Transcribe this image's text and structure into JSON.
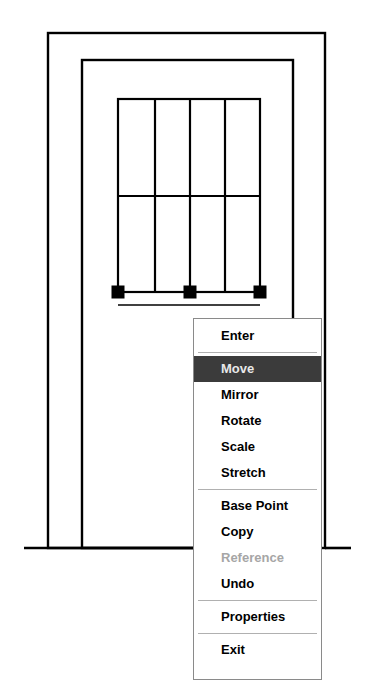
{
  "canvas": {
    "width": 373,
    "height": 695,
    "background": "#ffffff",
    "line_color": "#000000",
    "grip_color": "#000000",
    "dashed_color": "#000000"
  },
  "drawing": {
    "name": "cad-elevation-drawing",
    "description": "Architectural elevation: nested rectangles with mullioned window grid and three selection grips joined by a dashed stretch line",
    "outer_rect": {
      "x": 48,
      "y": 33,
      "width": 277,
      "height": 515
    },
    "middle_rect": {
      "x": 82,
      "y": 60,
      "width": 211,
      "height": 488
    },
    "window_rect": {
      "x": 118,
      "y": 99,
      "width": 142,
      "height": 193
    },
    "window_mullions_x": [
      155,
      190,
      225
    ],
    "window_transom_y": 196,
    "sill_line": {
      "x1": 118,
      "x2": 260,
      "y": 305
    },
    "ground_line_left": {
      "x1": 24,
      "x2": 195,
      "y": 548
    },
    "ground_line_right": {
      "x1": 325,
      "x2": 351,
      "y": 548
    },
    "grips": [
      {
        "name": "grip-left",
        "x": 118,
        "y": 292
      },
      {
        "name": "grip-middle",
        "x": 190,
        "y": 292
      },
      {
        "name": "grip-right",
        "x": 260,
        "y": 292
      }
    ],
    "grip_size": 13,
    "dashed_line": {
      "x1": 118,
      "x2": 260,
      "y": 292
    }
  },
  "context_menu": {
    "name": "cad-grip-context-menu",
    "x": 193,
    "y": 318,
    "width": 129,
    "highlight_color": "#3b3b3b",
    "highlight_text_color": "#e8e8e8",
    "disabled_text_color": "#a6a6a6",
    "groups": [
      {
        "items": [
          {
            "label": "Enter",
            "state": "normal"
          }
        ]
      },
      {
        "items": [
          {
            "label": "Move",
            "state": "highlighted"
          },
          {
            "label": "Mirror",
            "state": "normal"
          },
          {
            "label": "Rotate",
            "state": "normal"
          },
          {
            "label": "Scale",
            "state": "normal"
          },
          {
            "label": "Stretch",
            "state": "normal"
          }
        ]
      },
      {
        "items": [
          {
            "label": "Base Point",
            "state": "normal"
          },
          {
            "label": "Copy",
            "state": "normal"
          },
          {
            "label": "Reference",
            "state": "disabled"
          },
          {
            "label": "Undo",
            "state": "normal"
          }
        ]
      },
      {
        "items": [
          {
            "label": "Properties",
            "state": "normal"
          }
        ]
      },
      {
        "items": [
          {
            "label": "Exit",
            "state": "normal"
          }
        ]
      }
    ]
  }
}
